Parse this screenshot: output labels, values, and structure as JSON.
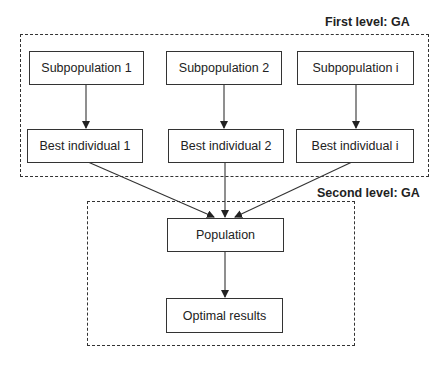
{
  "groups": {
    "first_level": {
      "label": "First level: GA"
    },
    "second_level": {
      "label": "Second level: GA"
    }
  },
  "nodes": {
    "subpop1": "Subpopulation 1",
    "subpop2": "Subpopulation 2",
    "subpopi": "Subpopulation i",
    "best1": "Best individual 1",
    "best2": "Best individual 2",
    "besti": "Best individual i",
    "population": "Population",
    "optimal": "Optimal results"
  },
  "edges": [
    [
      "subpop1",
      "best1"
    ],
    [
      "subpop2",
      "best2"
    ],
    [
      "subpopi",
      "besti"
    ],
    [
      "best1",
      "population"
    ],
    [
      "best2",
      "population"
    ],
    [
      "besti",
      "population"
    ],
    [
      "population",
      "optimal"
    ]
  ]
}
